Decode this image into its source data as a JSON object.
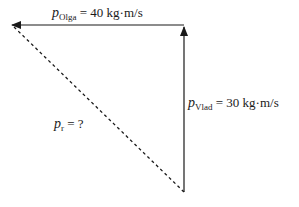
{
  "diagram": {
    "title": "",
    "vectors": [
      {
        "id": "p_olga",
        "symbol": "p",
        "subscript": "Olga",
        "value_text": "= 40 kg·m/s",
        "magnitude": 40,
        "unit": "kg·m/s",
        "direction": "left",
        "style": "solid"
      },
      {
        "id": "p_vlad",
        "symbol": "p",
        "subscript": "Vlad",
        "value_text": "= 30 kg·m/s",
        "magnitude": 30,
        "unit": "kg·m/s",
        "direction": "up",
        "style": "solid"
      },
      {
        "id": "p_r",
        "symbol": "p",
        "subscript": "r",
        "value_text": "= ?",
        "direction": "diagonal-up-left",
        "style": "dashed"
      }
    ],
    "colors": {
      "line": "#1a1a1a",
      "background": "#ffffff"
    }
  }
}
